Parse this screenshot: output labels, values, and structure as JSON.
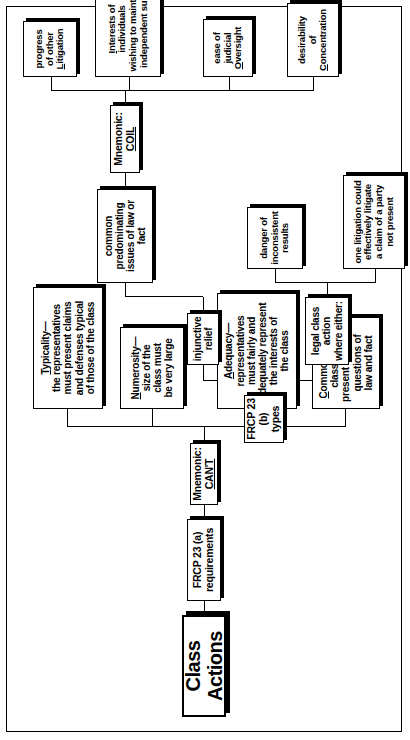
{
  "diagram": {
    "title": "Class Actions",
    "type": "hierarchical mind map",
    "root": "Class Actions",
    "nodes": {
      "title": "Class Actions",
      "frcp_a": "FRCP 23 (a) requirements",
      "mnemonic_cant_prefix": "Mnemonic: ",
      "mnemonic_cant": "CAN'T",
      "commonality": "Commonality—\nclass must\npresent common\nquestions of\nlaw and fact",
      "commonality_initial": "C",
      "commonality_rest": "ommonality—\nclass must\npresent common\nquestions of\nlaw and fact",
      "adequacy_initial": "A",
      "adequacy_rest": "dequacy—\nrepresentatives\nmust fairly and\nadequately represent\nthe interests of\nthe class",
      "numerosity_initial": "N",
      "numerosity_rest": "umerosity—\nsize of the\nclass must\nbe very large",
      "typicality_initial": "T",
      "typicality_rest": "ypicality—\nthe representatives\nmust present claims\nand defenses typical\nof those of the class",
      "frcp_b": "FRCP 23 (b)\ntypes",
      "legal_class_action": "legal class action\nwhere either:",
      "injunctive_relief": "injunctive relief",
      "common_predominating": "common predominating\nissues of law or fact",
      "one_litigation": "one litigation could\neffectively litigate\na claim of a party\nnot present",
      "danger": "danger of\ninconsistent\nresults",
      "mnemonic_coil_prefix": "Mnemonic: ",
      "mnemonic_coil": "COIL",
      "desirability_pre": "desirability\nof\n",
      "desirability_initial": "C",
      "desirability_rest": "oncentration",
      "ease_pre": "ease of\njudicial\n",
      "ease_initial": "O",
      "ease_rest": "versight",
      "interests_initial": "I",
      "interests_rest": "nterests of individuals\nwishing to maintain\nindependent suits",
      "progress_pre": "progress\nof other\n",
      "progress_initial": "L",
      "progress_rest": "itigation"
    },
    "colors": {
      "background": "#ffffff",
      "line": "#000000",
      "box_fill": "#ffffff",
      "shadow": "#000000"
    }
  }
}
